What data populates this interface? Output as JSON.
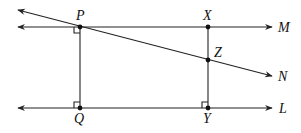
{
  "diagram": {
    "type": "geometry-parallel-lines",
    "labels": {
      "P": "P",
      "X": "X",
      "Z": "Z",
      "Q": "Q",
      "Y": "Y",
      "M": "M",
      "N": "N",
      "L": "L"
    },
    "points": {
      "P": [
        80,
        27
      ],
      "X": [
        208,
        27
      ],
      "Z": [
        208,
        60
      ],
      "Q": [
        80,
        108
      ],
      "Y": [
        208,
        108
      ]
    },
    "lines": [
      {
        "name": "M",
        "from": [
          18,
          27
        ],
        "to": [
          272,
          27
        ]
      },
      {
        "name": "L",
        "from": [
          18,
          108
        ],
        "to": [
          272,
          108
        ]
      },
      {
        "name": "N",
        "from": [
          18,
          10
        ],
        "to": [
          272,
          76
        ]
      }
    ],
    "segments": [
      [
        "P",
        "Q"
      ],
      [
        "X",
        "Y"
      ]
    ],
    "right_angles": [
      "P",
      "Q",
      "Y"
    ],
    "stroke_color": "#222222"
  }
}
